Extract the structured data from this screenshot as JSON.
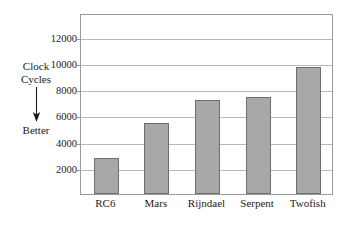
{
  "chart_data": {
    "type": "bar",
    "title": "",
    "xlabel": "",
    "ylabel": "Clock Cycles",
    "categories": [
      "RC6",
      "Mars",
      "Rijndael",
      "Serpent",
      "Twofish"
    ],
    "values": [
      2750,
      5450,
      7200,
      7400,
      9700
    ],
    "ylim": [
      0,
      13800
    ],
    "yticks": [
      2000,
      4000,
      6000,
      8000,
      10000,
      12000
    ],
    "ytick_labels": [
      "2000",
      "4000",
      "6000",
      "8000",
      "10000",
      "12000"
    ],
    "grid": true,
    "legend": false,
    "bar_color": "#a8a8a8",
    "bar_border_color": "#6e6e6e",
    "gridline_color": "#b9b9b9",
    "frame_color": "#9a9a9a"
  },
  "annotation": {
    "axis_label_line1": "Clock",
    "axis_label_line2": "Cycles",
    "arrow_direction": "down",
    "better_label": "Better"
  }
}
